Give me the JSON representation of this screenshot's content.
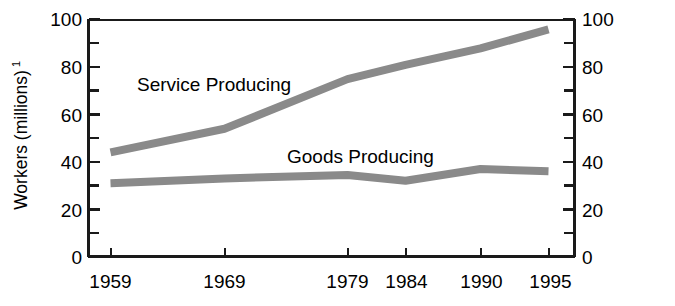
{
  "chart_data": {
    "type": "line",
    "title": "",
    "xlabel": "",
    "ylabel": "Workers (millions)",
    "ylabel_superscript": "1",
    "x": [
      1959,
      1969,
      1979,
      1984,
      1990,
      1995
    ],
    "categories": [
      "1959",
      "1969",
      "1979",
      "1984",
      "1990",
      "1995"
    ],
    "series": [
      {
        "name": "Service Producing",
        "values": [
          44,
          54,
          75,
          81,
          88,
          96
        ],
        "color": "#8a8a8a"
      },
      {
        "name": "Goods Producing",
        "values": [
          31,
          33,
          34.5,
          32,
          37,
          36
        ],
        "color": "#8a8a8a"
      }
    ],
    "ylim": [
      0,
      100
    ],
    "xlim": [
      1959,
      1995
    ],
    "y_ticks_major": [
      0,
      20,
      40,
      60,
      80,
      100
    ],
    "y_ticks_minor": [
      10,
      30,
      50,
      70,
      90
    ],
    "y_tick_labels_left": [
      "0",
      "20",
      "40",
      "60",
      "80",
      "100"
    ],
    "y_tick_labels_right": [
      "0",
      "20",
      "40",
      "60",
      "80",
      "100"
    ],
    "x_tick_labels": [
      "1959",
      "1969",
      "1979",
      "1984",
      "1990",
      "1995"
    ],
    "grid": false,
    "legend_position": "inline-annotations",
    "dual_y_axis": true,
    "annotations": [
      {
        "text": "Service Producing",
        "x": 1963,
        "y": 72
      },
      {
        "text": "Goods Producing",
        "x": 1977,
        "y": 44
      }
    ]
  },
  "axis": {
    "left_labels": [
      "100",
      "80",
      "60",
      "40",
      "20",
      "0"
    ],
    "right_labels": [
      "100",
      "80",
      "60",
      "40",
      "20",
      "0"
    ],
    "x_labels": [
      "1959",
      "1969",
      "1979",
      "1984",
      "1990",
      "1995"
    ],
    "y_title": "Workers (millions)",
    "y_title_superscript": "1"
  },
  "series_labels": {
    "service": "Service Producing",
    "goods": "Goods Producing"
  },
  "colors": {
    "series": "#8a8a8a",
    "axis": "#1a1a1a",
    "background": "#ffffff"
  }
}
